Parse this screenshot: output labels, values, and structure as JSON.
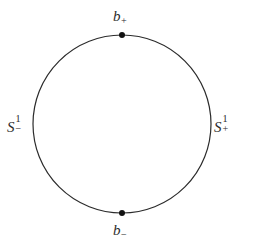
{
  "figure": {
    "name": "circle-decomposition-diagram",
    "background_color": "#ffffff",
    "stroke_color": "#2b2b2b",
    "marker_color": "#111111",
    "text_color": "#2b2b2b",
    "width": 257,
    "height": 249
  },
  "circle": {
    "center_x": 122,
    "center_y": 124,
    "radius": 89,
    "stroke_width": 1.2
  },
  "markers": [
    {
      "id": "b_plus",
      "x": 122,
      "y": 35,
      "radius": 3.0
    },
    {
      "id": "b_minus",
      "x": 122,
      "y": 213,
      "radius": 3.0
    }
  ],
  "labels": {
    "top": {
      "base": "b",
      "sub": "+",
      "sup": "",
      "full": "b+"
    },
    "bottom": {
      "base": "b",
      "sub": "−",
      "sup": "",
      "full": "b−"
    },
    "left": {
      "base": "S",
      "sub": "−",
      "sup": "1",
      "full": "S1−"
    },
    "right": {
      "base": "S",
      "sub": "+",
      "sup": "1",
      "full": "S1+"
    }
  }
}
